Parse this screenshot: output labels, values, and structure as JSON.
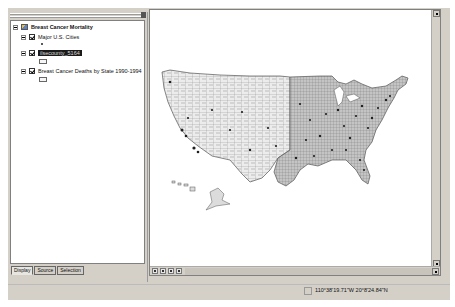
{
  "toc": {
    "data_frame": {
      "label": "Breast Cancer Mortality",
      "icon": "layers-frame-icon"
    },
    "layers": [
      {
        "label": "Major U.S. Cities",
        "checked": true,
        "symbol": "point"
      },
      {
        "label": "ilsecounty_5164",
        "checked": true,
        "selected": true,
        "symbol": "polygon"
      },
      {
        "label": "Breast Cancer Deaths by State 1990-1994",
        "checked": true,
        "symbol": "polygon"
      }
    ],
    "tabs": [
      {
        "label": "Display",
        "active": true
      },
      {
        "label": "Source",
        "active": false
      },
      {
        "label": "Selection",
        "active": false
      }
    ]
  },
  "map": {
    "description": "US county polygons map with major city points",
    "colors": {
      "background": "#ffffff",
      "fill": "#e8e8e8",
      "fill_east": "#b8b8b8",
      "outline": "#6a6a6a",
      "cities": "#1e1e1e"
    }
  },
  "view_buttons": [
    "data-view-icon",
    "layout-view-icon",
    "refresh-icon",
    "pause-icon"
  ],
  "status_bar": {
    "coordinates": "110°38'19.71\"W  20°8'24.84\"N"
  }
}
